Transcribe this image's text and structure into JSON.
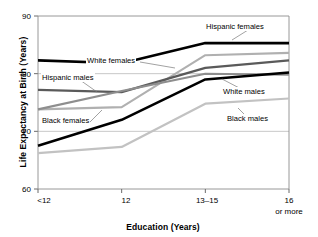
{
  "chart_data": {
    "type": "line",
    "title": "",
    "xlabel": "Education (Years)",
    "ylabel": "Life Expectancy at Birth (Years)",
    "categories": [
      "<12",
      "12",
      "13–15",
      "16 or more"
    ],
    "x_tick_labels": [
      "<12",
      "12",
      "13–15",
      "16"
    ],
    "x_tick_sublabel": "or more",
    "y_tick_labels": [
      "60",
      "70",
      "80",
      "90"
    ],
    "y_ticks": [
      60,
      70,
      80,
      90
    ],
    "ylim": [
      60,
      90
    ],
    "grid": "horizontal",
    "legend": "inline-callouts",
    "series": [
      {
        "name": "Hispanic females",
        "color": "#000000",
        "width": 2.6,
        "values": [
          82.3,
          81.8,
          85.3,
          85.3
        ]
      },
      {
        "name": "White females",
        "color": "#b0b0b0",
        "width": 2.1,
        "values": [
          73.8,
          74.2,
          83.2,
          83.6
        ]
      },
      {
        "name": "Hispanic males",
        "color": "#5a5a5a",
        "width": 2.2,
        "values": [
          77.2,
          76.8,
          81.0,
          82.3
        ]
      },
      {
        "name": "Black females",
        "color": "#8e8e8e",
        "width": 2.1,
        "values": [
          73.8,
          77.0,
          80.0,
          79.8
        ]
      },
      {
        "name": "White males",
        "color": "#000000",
        "width": 2.5,
        "values": [
          67.5,
          72.0,
          79.0,
          80.2
        ]
      },
      {
        "name": "Black males",
        "color": "#c2c2c2",
        "width": 2.2,
        "values": [
          66.2,
          67.3,
          74.8,
          75.7
        ]
      }
    ],
    "annotations": [
      {
        "text": "Hispanic females",
        "x": 205,
        "y": 22
      },
      {
        "text": "White females",
        "x": 86,
        "y": 56
      },
      {
        "text": "Hispanic males",
        "x": 41,
        "y": 73
      },
      {
        "text": "Black females",
        "x": 41,
        "y": 116
      },
      {
        "text": "White males",
        "x": 222,
        "y": 87
      },
      {
        "text": "Black males",
        "x": 226,
        "y": 114
      }
    ]
  }
}
